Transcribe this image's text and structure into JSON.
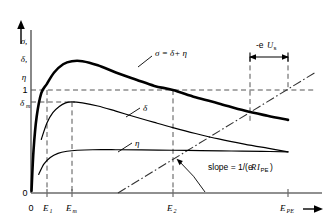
{
  "figure": {
    "name": "secondary-electron-yield-vs-primary-energy",
    "axes": {
      "y_axis_labels": [
        "σ,",
        "δ,",
        "η"
      ],
      "y_tick_labels": [
        "1",
        "δ",
        "0"
      ],
      "y_tick_sub": [
        "",
        "m",
        ""
      ],
      "x_tick_labels": [
        "0",
        "E",
        "E",
        "E",
        "E"
      ],
      "x_tick_subs": [
        "",
        "1",
        "m",
        "2",
        "PE"
      ],
      "x_axis_arrow": "→",
      "y_axis_arrow": "↑"
    },
    "curve_labels": {
      "sigma": "σ = δ+ η",
      "delta": "δ",
      "eta": "η"
    },
    "annotations": {
      "slope_text": "slope = 1/(e",
      "slope_italic": "R",
      "slope_italic2": "I",
      "slope_sub": "PE",
      "slope_tail": ")",
      "bracket_prefix": "-e",
      "bracket_italic": "U",
      "bracket_sub": "s"
    },
    "colors": {
      "ink": "#000000",
      "axis": "#6b6b6b",
      "dashed": "#555555",
      "background": "#ffffff"
    }
  },
  "chart_data": {
    "type": "line",
    "xlabel": "E_PE",
    "ylabel": "σ, δ, η",
    "xlim": [
      0,
      1
    ],
    "ylim": [
      0,
      1
    ],
    "grid": false,
    "legend": "inline-curve-labels",
    "reference_levels": [
      {
        "name": "unity-yield",
        "value": 1,
        "label": "1"
      },
      {
        "name": "delta-max",
        "value": 0.88,
        "label": "δm"
      },
      {
        "name": "zero",
        "value": 0,
        "label": "0"
      }
    ],
    "x_markers": [
      {
        "name": "origin",
        "label": "0",
        "x": 0
      },
      {
        "name": "first-crossover",
        "label": "E1",
        "x": 0.062
      },
      {
        "name": "delta-max-energy",
        "label": "Em",
        "x": 0.159
      },
      {
        "name": "second-crossover",
        "label": "E2",
        "x": 0.552
      },
      {
        "name": "primary-energy",
        "label": "EPE",
        "x": 1.0
      }
    ],
    "series": [
      {
        "name": "sigma",
        "label": "σ = δ+ η",
        "stroke_width": 2.6,
        "points": [
          [
            0.002,
            0.02
          ],
          [
            0.01,
            0.42
          ],
          [
            0.022,
            0.74
          ],
          [
            0.04,
            0.97
          ],
          [
            0.062,
            1.06
          ],
          [
            0.09,
            1.17
          ],
          [
            0.125,
            1.25
          ],
          [
            0.159,
            1.28
          ],
          [
            0.2,
            1.28
          ],
          [
            0.26,
            1.24
          ],
          [
            0.33,
            1.17
          ],
          [
            0.41,
            1.1
          ],
          [
            0.48,
            1.04
          ],
          [
            0.552,
            1.0
          ],
          [
            0.64,
            0.93
          ],
          [
            0.73,
            0.87
          ],
          [
            0.83,
            0.8
          ],
          [
            0.92,
            0.75
          ],
          [
            1.0,
            0.71
          ]
        ]
      },
      {
        "name": "delta",
        "label": "δ",
        "stroke_width": 1.2,
        "points": [
          [
            0.04,
            0.52
          ],
          [
            0.062,
            0.68
          ],
          [
            0.085,
            0.78
          ],
          [
            0.11,
            0.84
          ],
          [
            0.135,
            0.875
          ],
          [
            0.159,
            0.885
          ],
          [
            0.2,
            0.875
          ],
          [
            0.26,
            0.845
          ],
          [
            0.33,
            0.795
          ],
          [
            0.41,
            0.735
          ],
          [
            0.48,
            0.685
          ],
          [
            0.552,
            0.635
          ],
          [
            0.64,
            0.578
          ],
          [
            0.73,
            0.525
          ],
          [
            0.83,
            0.475
          ],
          [
            0.92,
            0.435
          ],
          [
            1.0,
            0.4
          ]
        ]
      },
      {
        "name": "eta",
        "label": "η",
        "stroke_width": 1.2,
        "points": [
          [
            0.03,
            0.18
          ],
          [
            0.05,
            0.28
          ],
          [
            0.075,
            0.345
          ],
          [
            0.105,
            0.385
          ],
          [
            0.14,
            0.405
          ],
          [
            0.18,
            0.415
          ],
          [
            0.24,
            0.42
          ],
          [
            0.33,
            0.42
          ],
          [
            0.43,
            0.418
          ],
          [
            0.552,
            0.415
          ],
          [
            0.66,
            0.412
          ],
          [
            0.78,
            0.408
          ],
          [
            0.9,
            0.404
          ],
          [
            1.0,
            0.4
          ]
        ]
      }
    ],
    "load_line": {
      "name": "load-line",
      "style": "dash-dot",
      "from": [
        0.3,
        0.0
      ],
      "to": [
        1.06,
        1.22
      ],
      "annotation": "slope = 1/(eRI_PE)"
    },
    "retarding_bracket": {
      "name": "retarding-voltage-bracket",
      "label": "-eUs",
      "from_x": 0.77,
      "to_x": 1.0
    }
  }
}
